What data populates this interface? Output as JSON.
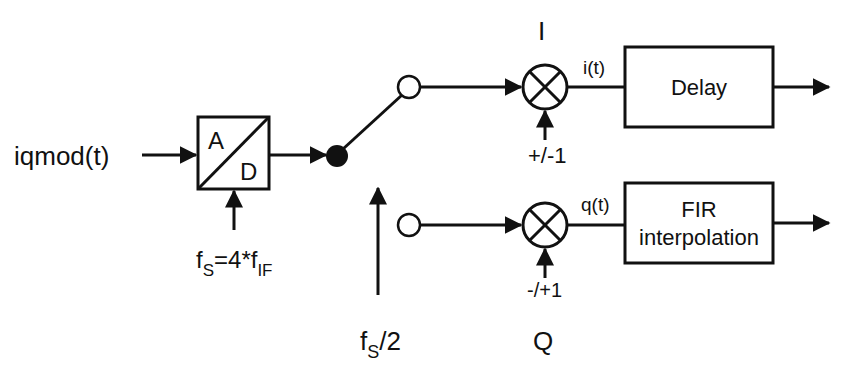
{
  "diagram": {
    "input_label": "iqmod(t)",
    "adc": {
      "top_letter": "A",
      "bottom_letter": "D"
    },
    "sampling": {
      "f": "f",
      "sub_s": "S",
      "eq": "=4*f",
      "sub_if": "IF"
    },
    "switch_control": {
      "f": "f",
      "sub_s": "S",
      "rest": "/2"
    },
    "i_branch": {
      "channel_label": "I",
      "mixer_input": "+/-1",
      "signal_label": "i(t)",
      "block_label": "Delay"
    },
    "q_branch": {
      "channel_label": "Q",
      "mixer_input": "-/+1",
      "signal_label": "q(t)",
      "block_label_line1": "FIR",
      "block_label_line2": "interpolation"
    },
    "colors": {
      "stroke": "#111111",
      "background": "#ffffff"
    }
  }
}
